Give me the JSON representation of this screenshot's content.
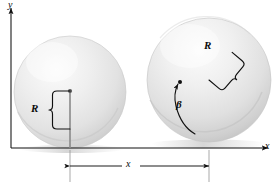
{
  "figure": {
    "type": "physics-diagram",
    "background_color": "#ffffff",
    "line_color": "#101010",
    "sphere_fill_light": "#f4f4f4",
    "sphere_fill_mid": "#dcdcdc",
    "sphere_fill_dark": "#bdbdbd"
  },
  "axes": {
    "y_label": "y",
    "x_label": "x",
    "y_axis_name": "vertical-axis",
    "x_axis_name": "horizontal-axis-ground-line"
  },
  "spheres": [
    {
      "id": "sphere-initial",
      "center_x": 70,
      "center_y": 92,
      "radius": 56,
      "state": "initial position"
    },
    {
      "id": "sphere-rolled",
      "center_x": 209,
      "center_y": 80,
      "radius": 62,
      "state": "after rolling through angle beta"
    }
  ],
  "annotations": {
    "radius_left": {
      "label": "R",
      "name": "radius-label-left",
      "orientation": "vertical"
    },
    "radius_right": {
      "label": "R",
      "name": "radius-label-right",
      "orientation": "tilted"
    },
    "rotation_angle": {
      "label": "β",
      "name": "rotation-angle-label"
    },
    "displacement": {
      "label": "x",
      "name": "displacement-dimension-label"
    }
  }
}
